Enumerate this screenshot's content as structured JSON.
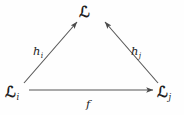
{
  "diagram": {
    "type": "commutative-triangle",
    "background_color": "#fefefe",
    "stroke_color": "#555555",
    "text_color": "#1d1d1d",
    "nodes": [
      {
        "id": "top",
        "object": "ℒ",
        "subscript": "",
        "x": 92,
        "y": 12
      },
      {
        "id": "left",
        "object": "ℒ",
        "subscript": "i",
        "x": 14,
        "y": 92
      },
      {
        "id": "right",
        "object": "ℒ",
        "subscript": "j",
        "x": 166,
        "y": 92
      }
    ],
    "arrows": [
      {
        "id": "h-i",
        "label_base": "h",
        "label_subscript": "i",
        "from": "left",
        "to": "top",
        "from_x": 24,
        "from_y": 83,
        "to_x": 78,
        "to_y": 21
      },
      {
        "id": "h-j",
        "label_base": "h",
        "label_subscript": "j",
        "from": "right",
        "to": "top",
        "from_x": 158,
        "from_y": 83,
        "to_x": 104,
        "to_y": 21
      },
      {
        "id": "f",
        "label_base": "f",
        "label_subscript": "",
        "from": "left",
        "to": "right",
        "from_x": 29,
        "from_y": 90,
        "to_x": 155,
        "to_y": 90
      }
    ]
  }
}
